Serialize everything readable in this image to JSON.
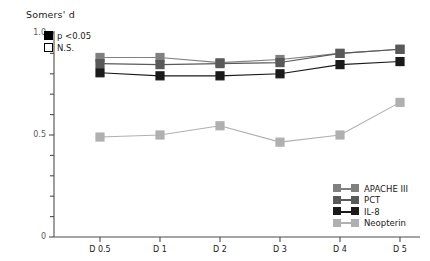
{
  "chart_data": {
    "type": "line",
    "title": "Somers' d",
    "xlabel": "",
    "ylabel": "Somers' d",
    "x": [
      "D 0.5",
      "D 1",
      "D 2",
      "D 3",
      "D 4",
      "D 5"
    ],
    "categories": [
      "D 0.5",
      "D 1",
      "D 2",
      "D 3",
      "D 4",
      "D 5"
    ],
    "ylim": [
      0,
      1.0
    ],
    "yticks": [
      0,
      0.5,
      1.0
    ],
    "ytick_labels": [
      "0",
      "0.5",
      "1.0"
    ],
    "yminor_step": 0.1,
    "grid": false,
    "legend_position": "bottom-right",
    "series": [
      {
        "name": "APACHE III",
        "color": "#808080",
        "values": [
          0.88,
          0.88,
          0.855,
          0.87,
          0.9,
          0.92
        ],
        "significance": [
          "p <0.05",
          "p <0.05",
          "p <0.05",
          "p <0.05",
          "p <0.05",
          "p <0.05"
        ]
      },
      {
        "name": "PCT",
        "color": "#595959",
        "values": [
          0.85,
          0.845,
          0.85,
          0.855,
          0.9,
          0.92
        ],
        "significance": [
          "p <0.05",
          "p <0.05",
          "p <0.05",
          "p <0.05",
          "p <0.05",
          "p <0.05"
        ]
      },
      {
        "name": "IL-8",
        "color": "#1a1a1a",
        "values": [
          0.805,
          0.79,
          0.79,
          0.8,
          0.845,
          0.86
        ],
        "significance": [
          "p <0.05",
          "p <0.05",
          "p <0.05",
          "p <0.05",
          "p <0.05",
          "p <0.05"
        ]
      },
      {
        "name": "Neopterin",
        "color": "#b0b0b0",
        "values": [
          0.49,
          0.5,
          0.545,
          0.465,
          0.5,
          0.66
        ],
        "significance": [
          "p <0.05",
          "p <0.05",
          "p <0.05",
          "p <0.05",
          "p <0.05",
          "p <0.05"
        ]
      }
    ]
  },
  "significance_legend": {
    "items": [
      {
        "label": "p <0.05",
        "style": "filled"
      },
      {
        "label": "N.S.",
        "style": "hollow"
      }
    ]
  }
}
